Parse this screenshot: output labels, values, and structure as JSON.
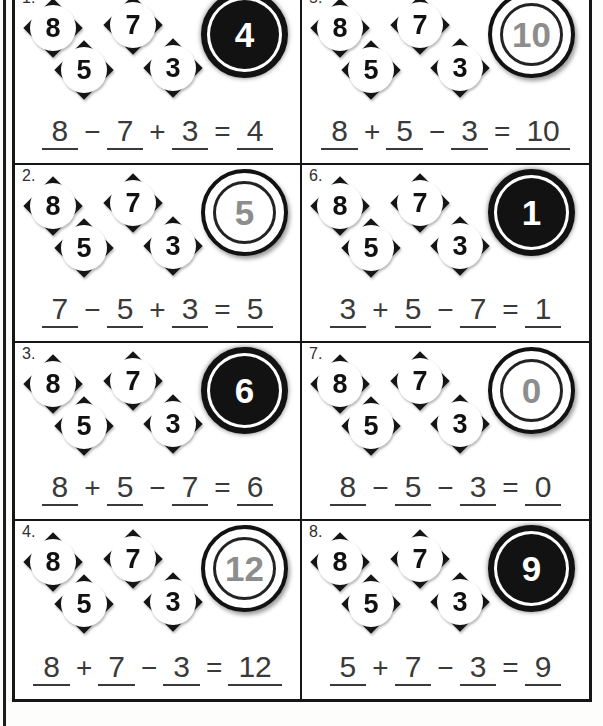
{
  "worksheet": {
    "diamond_values": [
      "8",
      "7",
      "5",
      "3"
    ],
    "equals_sign": "=",
    "problems": [
      {
        "label": "1.",
        "circle_style": "dark",
        "answer": "4",
        "terms": [
          "8",
          "7",
          "3"
        ],
        "ops": [
          "−",
          "+"
        ]
      },
      {
        "label": "5.",
        "circle_style": "light",
        "answer": "10",
        "terms": [
          "8",
          "5",
          "3"
        ],
        "ops": [
          "+",
          "−"
        ]
      },
      {
        "label": "2.",
        "circle_style": "light",
        "answer": "5",
        "terms": [
          "7",
          "5",
          "3"
        ],
        "ops": [
          "−",
          "+"
        ]
      },
      {
        "label": "6.",
        "circle_style": "dark",
        "answer": "1",
        "terms": [
          "3",
          "5",
          "7"
        ],
        "ops": [
          "+",
          "−"
        ]
      },
      {
        "label": "3.",
        "circle_style": "dark",
        "answer": "6",
        "terms": [
          "8",
          "5",
          "7"
        ],
        "ops": [
          "+",
          "−"
        ]
      },
      {
        "label": "7.",
        "circle_style": "light",
        "answer": "0",
        "terms": [
          "8",
          "5",
          "3"
        ],
        "ops": [
          "−",
          "−"
        ]
      },
      {
        "label": "4.",
        "circle_style": "light",
        "answer": "12",
        "terms": [
          "8",
          "7",
          "3"
        ],
        "ops": [
          "+",
          "−"
        ]
      },
      {
        "label": "8.",
        "circle_style": "dark",
        "answer": "9",
        "terms": [
          "5",
          "7",
          "3"
        ],
        "ops": [
          "+",
          "−"
        ]
      }
    ],
    "colors": {
      "line": "#161616",
      "muted_number": "#8d8d8d",
      "equation_text": "#3a3a3a",
      "dark_circle_fill": "#121212"
    }
  }
}
